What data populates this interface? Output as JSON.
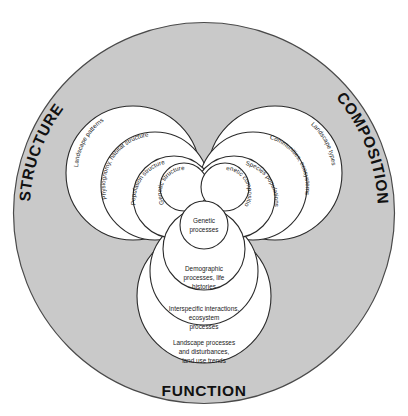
{
  "diagram": {
    "colors": {
      "outer_disc_fill": "#c9c9c9",
      "lobe_fill": "#ffffff",
      "stroke": "#2b2b2b",
      "text": "#1b1b1b"
    },
    "axis_labels": {
      "structure": "STRUCTURE",
      "composition": "COMPOSITION",
      "function": "FUNCTION"
    },
    "structure_levels": [
      {
        "label": "Landscape patterns",
        "level": 4
      },
      {
        "label": "Physiognomy, habitat structure",
        "level": 3
      },
      {
        "label": "Population structure",
        "level": 2
      },
      {
        "label": "Genetic structure",
        "level": 1
      }
    ],
    "composition_levels": [
      {
        "label": "Landscape types",
        "level": 4
      },
      {
        "label": "Communities, ecosystems",
        "level": 3
      },
      {
        "label": "Species populations",
        "level": 2
      },
      {
        "label": "Genetic composition",
        "level": 1
      }
    ],
    "function_levels": [
      {
        "label_line1": "Landscape processes",
        "label_line2": "and disturbances,",
        "label_line3": "land use trends",
        "level": 4
      },
      {
        "label_line1": "Interspecific interactions,",
        "label_line2": "ecosystem",
        "label_line3": "processes",
        "level": 3
      },
      {
        "label_line1": "Demographic",
        "label_line2": "processes, life",
        "label_line3": "histories",
        "level": 2
      },
      {
        "label_line1": "Genetic",
        "label_line2": "processes",
        "label_line3": "",
        "level": 1
      }
    ]
  }
}
